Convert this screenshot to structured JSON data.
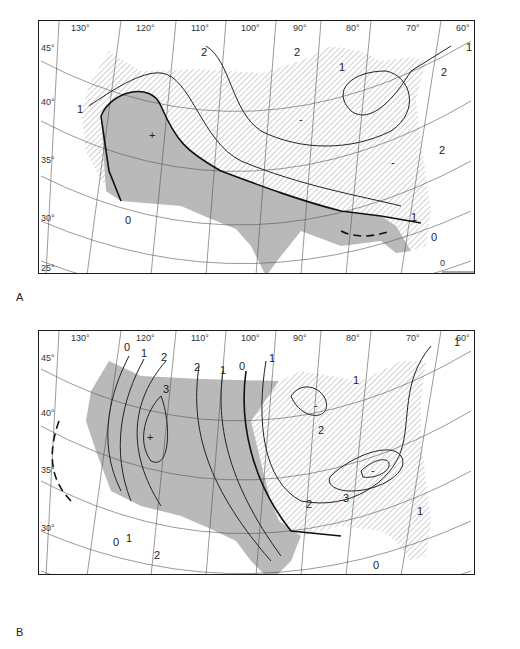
{
  "figure": {
    "panels": [
      {
        "id": "A",
        "label": "A",
        "longitude_labels": [
          "130°",
          "120°",
          "110°",
          "100°",
          "90°",
          "80°",
          "70°",
          "60°"
        ],
        "latitude_labels": [
          "45°",
          "40°",
          "35°",
          "30°",
          "25°"
        ],
        "contour_labels": [
          "2",
          "2",
          "1",
          "1",
          "2",
          "1",
          "2",
          "1",
          "0",
          "0",
          "-",
          "-",
          "+"
        ],
        "scale_bar": {
          "start": "0",
          "end": "300",
          "unit": "Miles"
        }
      },
      {
        "id": "B",
        "label": "B",
        "longitude_labels": [
          "130°",
          "120°",
          "110°",
          "100°",
          "90°",
          "80°",
          "70°",
          "60°"
        ],
        "latitude_labels": [
          "45°",
          "40°",
          "35°",
          "30°",
          "25°"
        ],
        "contour_labels": [
          "0",
          "1",
          "2",
          "2",
          "1",
          "0",
          "1",
          "3",
          "1",
          "1",
          "2",
          "2",
          "3",
          "1",
          "0",
          "0",
          "1",
          "2",
          "1",
          "2",
          "-",
          "-",
          "+"
        ],
        "scale_bar": {
          "start": "0",
          "end": "300",
          "unit": "Miles"
        }
      }
    ],
    "colors": {
      "positive_fill": "#b9b9b9",
      "hatch": "#8a8a8a",
      "lines": "#222222",
      "background": "#ffffff"
    }
  }
}
